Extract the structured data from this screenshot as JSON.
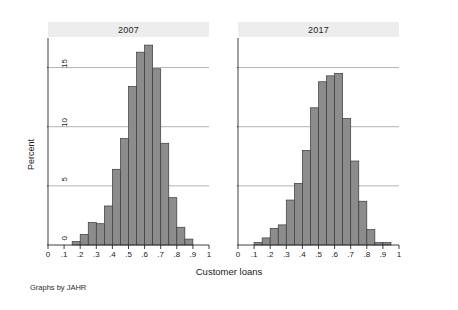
{
  "chart_data": {
    "type": "bar",
    "title": "",
    "xlabel": "Customer loans",
    "ylabel": "Percent",
    "note": "Graphs by JAHR",
    "grid": true,
    "legend_position": "none",
    "xlim": [
      0,
      1
    ],
    "ylim": [
      0,
      17.5
    ],
    "xticks": [
      "0",
      ".1",
      ".2",
      ".3",
      ".4",
      ".5",
      ".6",
      ".7",
      ".8",
      ".9",
      "1"
    ],
    "xtick_values": [
      0,
      0.1,
      0.2,
      0.3,
      0.4,
      0.5,
      0.6,
      0.7,
      0.8,
      0.9,
      1
    ],
    "yticks": [
      "0",
      "5",
      "10",
      "15"
    ],
    "ytick_values": [
      0,
      5,
      10,
      15
    ],
    "bin_width": 0.05,
    "panels": [
      {
        "label": "2007",
        "bins": [
          0.15,
          0.2,
          0.25,
          0.3,
          0.35,
          0.4,
          0.45,
          0.5,
          0.55,
          0.6,
          0.65,
          0.7,
          0.75,
          0.8,
          0.85
        ],
        "values": [
          0.3,
          0.9,
          1.9,
          1.8,
          3.3,
          6.4,
          9.0,
          13.4,
          16.3,
          16.9,
          14.9,
          8.6,
          4.0,
          1.5,
          0.5
        ]
      },
      {
        "label": "2017",
        "bins": [
          0.1,
          0.15,
          0.2,
          0.25,
          0.3,
          0.35,
          0.4,
          0.45,
          0.5,
          0.55,
          0.6,
          0.65,
          0.7,
          0.75,
          0.8,
          0.85,
          0.9
        ],
        "values": [
          0.2,
          0.6,
          1.4,
          1.7,
          3.8,
          5.2,
          8.0,
          11.6,
          13.8,
          14.3,
          14.5,
          10.7,
          7.1,
          3.7,
          1.3,
          0.2,
          0.2
        ]
      }
    ],
    "colors": {
      "bar_fill": "#8c8c8c",
      "bar_edge": "#3a3a3a",
      "grid": "#9f9f9f",
      "axis": "#2b2b2b",
      "title_band": "#ededed",
      "background": "#ffffff"
    }
  }
}
